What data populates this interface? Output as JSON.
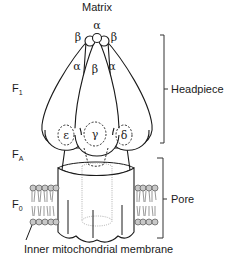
{
  "diagram": {
    "top_label": "Matrix",
    "bottom_label": "Inner mitochondrial membrane",
    "left_labels": [
      {
        "main": "F",
        "sub": "1"
      },
      {
        "main": "F",
        "sub": "A"
      },
      {
        "main": "F",
        "sub": "0"
      }
    ],
    "right_labels": {
      "headpiece": "Headpiece",
      "pore": "Pore"
    },
    "subunits": {
      "top_alpha": "α",
      "top_beta_left": "β",
      "top_beta_right": "β",
      "alpha_left": "α",
      "beta_center": "β",
      "alpha_right": "α",
      "epsilon": "ε",
      "gamma": "γ",
      "delta": "δ"
    },
    "colors": {
      "line": "#1a1a1a",
      "lipid_head": "#c8c8c8",
      "dotted": "#9a9a9a",
      "background": "#ffffff"
    }
  }
}
